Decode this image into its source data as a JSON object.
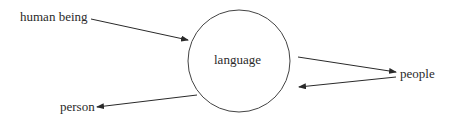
{
  "diagram": {
    "center_node": {
      "label": "language",
      "shape": "circle"
    },
    "nodes": [
      {
        "id": "human_being",
        "label": "human being"
      },
      {
        "id": "people",
        "label": "people"
      },
      {
        "id": "person",
        "label": "person"
      }
    ],
    "edges": [
      {
        "from": "human being",
        "to": "language"
      },
      {
        "from": "language",
        "to": "people"
      },
      {
        "from": "people",
        "to": "language"
      },
      {
        "from": "language",
        "to": "person"
      }
    ],
    "colors": {
      "stroke": "#2a2a2a",
      "background": "#ffffff"
    }
  }
}
